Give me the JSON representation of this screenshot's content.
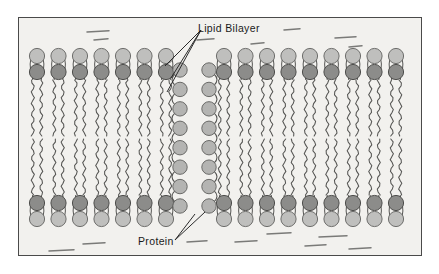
{
  "figure": {
    "background_color": "#f2f1ee",
    "frame_color": "#4a4a4a",
    "page_background": "#ffffff"
  },
  "labels": [
    {
      "id": "lipid-bilayer",
      "text": "Lipid Bilayer",
      "x": 198,
      "y": 22,
      "leader_count": 3
    },
    {
      "id": "protein",
      "text": "Protein",
      "x": 138,
      "y": 235,
      "leader_count": 2
    }
  ],
  "colors": {
    "head_outer_light": "#bfbfbd",
    "head_outer_light_stroke": "#6e6e6c",
    "head_inner_dark": "#8c8c8a",
    "head_inner_dark_stroke": "#4e4e4c",
    "protein_bead": "#b4b4b2",
    "protein_bead_stroke": "#6a6a68",
    "tail_stroke": "#555553",
    "dash_stroke": "#7a7a78",
    "leader_stroke": "#2b2b2b"
  },
  "membrane": {
    "description": "Phospholipid bilayer with two leaflets and an embedded transmembrane protein channel",
    "leaflets": [
      {
        "name": "upper-leaflet",
        "outer_head_row_y": 38,
        "inner_head_row_y": 54,
        "tail_start_y": 62,
        "tail_end_y": 118
      },
      {
        "name": "lower-leaflet",
        "inner_head_row_y": 185,
        "outer_head_row_y": 201,
        "tail_start_y": 121,
        "tail_end_y": 177
      }
    ],
    "left_segment": {
      "lipid_count": 7,
      "first_x": 18,
      "spacing": 21.5
    },
    "right_segment": {
      "lipid_count": 9,
      "first_x": 205,
      "spacing": 21.5
    },
    "head_radius_outer": 7.6,
    "head_radius_inner": 7.6,
    "tail_amplitude": 1.6,
    "tail_wavelength": 11
  },
  "protein": {
    "description": "Transmembrane channel protein rendered as two vertical beaded chains",
    "columns": [
      {
        "name": "left-protein-column",
        "x": 161,
        "bead_count": 8,
        "top_y": 52,
        "bottom_y": 188
      },
      {
        "name": "right-protein-column",
        "x": 190,
        "bead_count": 8,
        "top_y": 52,
        "bottom_y": 188
      }
    ],
    "bead_radius": 7.2,
    "channel_gap_width": 29
  },
  "fluid_dashes": {
    "description": "Short horizontal strokes representing surrounding aqueous fluid",
    "top": [
      {
        "x": 68,
        "y": 14,
        "w": 22
      },
      {
        "x": 75,
        "y": 22,
        "w": 14
      },
      {
        "x": 178,
        "y": 22,
        "w": 17
      },
      {
        "x": 265,
        "y": 12,
        "w": 16
      },
      {
        "x": 232,
        "y": 26,
        "w": 13
      },
      {
        "x": 316,
        "y": 20,
        "w": 21
      },
      {
        "x": 330,
        "y": 29,
        "w": 13
      }
    ],
    "bottom": [
      {
        "x": 64,
        "y": 226,
        "w": 22
      },
      {
        "x": 30,
        "y": 233,
        "w": 25
      },
      {
        "x": 168,
        "y": 224,
        "w": 20
      },
      {
        "x": 216,
        "y": 224,
        "w": 22
      },
      {
        "x": 248,
        "y": 216,
        "w": 24
      },
      {
        "x": 300,
        "y": 219,
        "w": 28
      },
      {
        "x": 286,
        "y": 228,
        "w": 21
      },
      {
        "x": 330,
        "y": 231,
        "w": 22
      }
    ]
  }
}
